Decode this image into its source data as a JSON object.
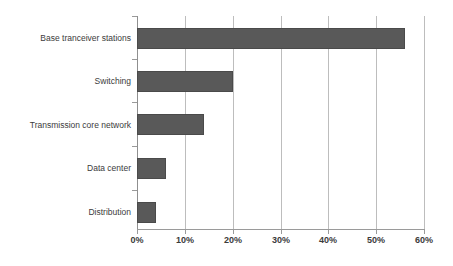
{
  "chart_data": {
    "type": "bar",
    "orientation": "horizontal",
    "title": "",
    "subtitle": "",
    "xlabel": "",
    "ylabel": "",
    "categories": [
      "Base tranceiver stations",
      "Switching",
      "Transmission core network",
      "Data center",
      "Distribution"
    ],
    "values": [
      56,
      20,
      14,
      6,
      4
    ],
    "value_unit": "%",
    "xlim": [
      0,
      60
    ],
    "xticks": [
      0,
      10,
      20,
      30,
      40,
      50,
      60
    ],
    "xtick_labels": [
      "0%",
      "10%",
      "20%",
      "30%",
      "40%",
      "50%",
      "60%"
    ],
    "grid": "vertical",
    "legend": null,
    "legend_position": "none",
    "series": [
      {
        "name": "Share of energy consumption",
        "values": [
          56,
          20,
          14,
          6,
          4
        ],
        "color": "#595959"
      }
    ],
    "colors": {
      "bar_fill": "#595959",
      "bar_border": "#4a4a4a",
      "gridline": "#bdbdbd",
      "axis_line": "#9a9a9a",
      "text": "#3b3b3b",
      "background": "#ffffff"
    }
  }
}
